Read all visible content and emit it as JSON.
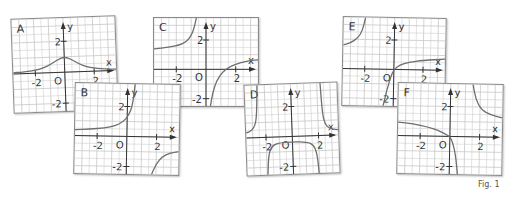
{
  "figure": {
    "caption": "Fig. 1",
    "colors": {
      "grid": "#c8c8c8",
      "axis": "#333333",
      "curve": "#6e6e6e",
      "text": "#333333",
      "border": "#8a8a8a"
    }
  },
  "chart_data": [
    {
      "type": "line",
      "title": "A",
      "xlabel": "x",
      "ylabel": "y",
      "origin_label": "O",
      "xlim": [
        -3.5,
        3.5
      ],
      "ylim": [
        -2.5,
        3.5
      ],
      "xticks": [
        -2,
        2
      ],
      "yticks": [
        2,
        -2
      ],
      "xtick_labels": [
        "-2",
        "2"
      ],
      "ytick_labels": [
        "2",
        "-2"
      ],
      "grid": true,
      "series": [
        {
          "name": "A-curve",
          "points": [
            [
              -3.5,
              0.08
            ],
            [
              -3,
              0.1
            ],
            [
              -2.5,
              0.14
            ],
            [
              -2,
              0.2
            ],
            [
              -1.5,
              0.3
            ],
            [
              -1,
              0.5
            ],
            [
              -0.5,
              0.8
            ],
            [
              0,
              1
            ],
            [
              0.5,
              0.8
            ],
            [
              1,
              0.5
            ],
            [
              1.5,
              0.3
            ],
            [
              2,
              0.2
            ],
            [
              2.5,
              0.14
            ],
            [
              3,
              0.1
            ],
            [
              3.5,
              0.08
            ]
          ]
        }
      ]
    },
    {
      "type": "line",
      "title": "B",
      "xlabel": "x",
      "ylabel": "y",
      "origin_label": "O",
      "xlim": [
        -3.5,
        3.5
      ],
      "ylim": [
        -2.5,
        3.5
      ],
      "xticks": [
        -2,
        2
      ],
      "yticks": [
        2,
        -2
      ],
      "xtick_labels": [
        "-2",
        "2"
      ],
      "ytick_labels": [
        "2",
        "-2"
      ],
      "grid": true,
      "series": [
        {
          "name": "B-left",
          "points": [
            [
              -3.5,
              0.4
            ],
            [
              -2.5,
              0.45
            ],
            [
              -1.5,
              0.55
            ],
            [
              -0.8,
              0.7
            ],
            [
              -0.3,
              0.95
            ],
            [
              0.1,
              1.4
            ],
            [
              0.35,
              2.1
            ],
            [
              0.5,
              3.5
            ]
          ]
        },
        {
          "name": "B-right",
          "points": [
            [
              1.7,
              -2.5
            ],
            [
              2,
              -1.8
            ],
            [
              2.4,
              -1.3
            ],
            [
              2.9,
              -1.05
            ],
            [
              3.5,
              -0.95
            ]
          ]
        }
      ]
    },
    {
      "type": "line",
      "title": "C",
      "xlabel": "x",
      "ylabel": "y",
      "origin_label": "O",
      "xlim": [
        -3.5,
        3.5
      ],
      "ylim": [
        -2.5,
        3.5
      ],
      "xticks": [
        -2,
        2
      ],
      "yticks": [
        2,
        -2
      ],
      "xtick_labels": [
        "-2",
        "2"
      ],
      "ytick_labels": [
        "2",
        "-2"
      ],
      "grid": true,
      "series": [
        {
          "name": "C-left",
          "points": [
            [
              -3.5,
              1.4
            ],
            [
              -2.5,
              1.5
            ],
            [
              -1.8,
              1.65
            ],
            [
              -1.3,
              1.9
            ],
            [
              -1,
              2.3
            ],
            [
              -0.8,
              2.8
            ],
            [
              -0.65,
              3.5
            ]
          ]
        },
        {
          "name": "C-right",
          "points": [
            [
              0.3,
              -2.5
            ],
            [
              0.45,
              -1.6
            ],
            [
              0.7,
              -0.8
            ],
            [
              1.1,
              -0.2
            ],
            [
              1.6,
              0.2
            ],
            [
              2.3,
              0.45
            ],
            [
              3,
              0.6
            ],
            [
              3.5,
              0.65
            ]
          ]
        }
      ]
    },
    {
      "type": "line",
      "title": "D",
      "xlabel": "x",
      "ylabel": "y",
      "origin_label": "O",
      "xlim": [
        -3.5,
        3.5
      ],
      "ylim": [
        -2.5,
        3.5
      ],
      "xticks": [
        -2,
        2
      ],
      "yticks": [
        2,
        -2
      ],
      "xtick_labels": [
        "-2",
        "2"
      ],
      "ytick_labels": [
        "2",
        "-2"
      ],
      "grid": true,
      "series": [
        {
          "name": "D-left",
          "points": [
            [
              -3.5,
              0.35
            ],
            [
              -3.1,
              0.45
            ],
            [
              -2.8,
              0.8
            ],
            [
              -2.65,
              1.5
            ],
            [
              -2.55,
              3.5
            ]
          ]
        },
        {
          "name": "D-middle",
          "points": [
            [
              -1.95,
              -2.5
            ],
            [
              -1.85,
              -1.2
            ],
            [
              -1.6,
              -0.6
            ],
            [
              -1.1,
              -0.4
            ],
            [
              0,
              -0.35
            ],
            [
              1.1,
              -0.4
            ],
            [
              1.6,
              -0.6
            ],
            [
              1.85,
              -1.2
            ],
            [
              1.95,
              -2.5
            ]
          ]
        },
        {
          "name": "D-right",
          "points": [
            [
              2.25,
              3.5
            ],
            [
              2.35,
              1.5
            ],
            [
              2.5,
              0.8
            ],
            [
              2.8,
              0.45
            ],
            [
              3.5,
              0.35
            ]
          ]
        }
      ]
    },
    {
      "type": "line",
      "title": "E",
      "xlabel": "x",
      "ylabel": "y",
      "origin_label": "O",
      "xlim": [
        -3.5,
        3.5
      ],
      "ylim": [
        -2.5,
        3.5
      ],
      "xticks": [
        -2,
        2
      ],
      "yticks": [
        2,
        -2
      ],
      "xtick_labels": [
        "-2",
        "2"
      ],
      "ytick_labels": [
        "2",
        "-2"
      ],
      "grid": true,
      "series": [
        {
          "name": "E-left",
          "points": [
            [
              -3.5,
              1.6
            ],
            [
              -3,
              1.75
            ],
            [
              -2.5,
              2.1
            ],
            [
              -2.2,
              2.6
            ],
            [
              -2,
              3.5
            ]
          ]
        },
        {
          "name": "E-right",
          "points": [
            [
              -0.7,
              -2.5
            ],
            [
              -0.45,
              -1.4
            ],
            [
              -0.2,
              -0.5
            ],
            [
              0,
              0
            ],
            [
              0.4,
              0.3
            ],
            [
              1,
              0.5
            ],
            [
              2,
              0.65
            ],
            [
              3.5,
              0.75
            ]
          ]
        }
      ]
    },
    {
      "type": "line",
      "title": "F",
      "xlabel": "x",
      "ylabel": "y",
      "origin_label": "O",
      "xlim": [
        -3.5,
        3.5
      ],
      "ylim": [
        -2.5,
        3.5
      ],
      "xticks": [
        -2,
        2
      ],
      "yticks": [
        2,
        -2
      ],
      "xtick_labels": [
        "-2",
        "2"
      ],
      "ytick_labels": [
        "2",
        "-2"
      ],
      "grid": true,
      "series": [
        {
          "name": "F-left",
          "points": [
            [
              -3.5,
              0.9
            ],
            [
              -2.5,
              0.8
            ],
            [
              -1.5,
              0.6
            ],
            [
              -0.8,
              0.4
            ],
            [
              -0.2,
              0.1
            ],
            [
              0,
              0
            ],
            [
              0.2,
              -0.4
            ],
            [
              0.4,
              -1.2
            ],
            [
              0.55,
              -2.5
            ]
          ]
        },
        {
          "name": "F-right",
          "points": [
            [
              1.5,
              3.5
            ],
            [
              1.7,
              2.5
            ],
            [
              2.1,
              1.8
            ],
            [
              2.7,
              1.5
            ],
            [
              3.5,
              1.3
            ]
          ]
        }
      ]
    }
  ]
}
